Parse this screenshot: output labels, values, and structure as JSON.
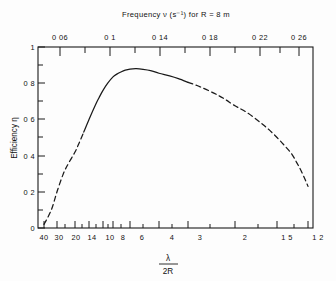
{
  "chart_data": {
    "type": "line",
    "title": "Frequency ν (s⁻¹) for R = 8 m",
    "xlabel": "λ / 2R",
    "xlabel_numerator": "λ",
    "xlabel_denominator": "2R",
    "ylabel": "Efficiency η",
    "ylim": [
      0,
      1
    ],
    "grid": false,
    "legend": null,
    "x_axis_bottom": {
      "name": "λ/2R",
      "scale": "reciprocal",
      "tick_labels": [
        "40",
        "30",
        "20",
        "14",
        "10",
        "8",
        "6",
        "4",
        "3",
        "2",
        "1 5",
        "1 2"
      ],
      "tick_values": [
        40,
        30,
        20,
        14,
        10,
        8,
        6,
        4,
        3,
        2,
        1.5,
        1.2
      ],
      "minor_tick_values": [
        25,
        18,
        16,
        12,
        9,
        7,
        5,
        3.5,
        2.5,
        1.75,
        1.35
      ],
      "range": [
        40,
        1.2
      ]
    },
    "x_axis_top": {
      "name": "Frequency ν (s⁻¹) for R = 8 m",
      "tick_labels": [
        "0 06",
        "0 1",
        "0 14",
        "0 18",
        "0 22",
        "0 26"
      ],
      "tick_values": [
        0.06,
        0.1,
        0.14,
        0.18,
        0.22,
        0.26
      ],
      "minor_tick_values": [
        0.08,
        0.12,
        0.16,
        0.2,
        0.24,
        0.28
      ],
      "units": "s^-1",
      "R_value": "8 m"
    },
    "y_axis": {
      "name": "Efficiency η",
      "tick_labels": [
        "0",
        "0 2",
        "0 4",
        "0 6",
        "0 8",
        "1"
      ],
      "tick_values": [
        0,
        0.2,
        0.4,
        0.6,
        0.8,
        1.0
      ],
      "minor_tick_values": [
        0.1,
        0.3,
        0.5,
        0.7,
        0.9
      ]
    },
    "series": [
      {
        "name": "efficiency",
        "line_color": "#1a1a1a",
        "segments": [
          {
            "style": "dashed",
            "x": [
              40,
              34,
              30,
              26,
              23,
              20,
              18,
              16
            ],
            "y": [
              0.02,
              0.1,
              0.2,
              0.3,
              0.36,
              0.42,
              0.47,
              0.53
            ]
          },
          {
            "style": "solid",
            "x": [
              16,
              14,
              12,
              11,
              10,
              9,
              8,
              7.5,
              7,
              6.5,
              6,
              5.5,
              5,
              4.5,
              4,
              3.6,
              3.3,
              3.0
            ],
            "y": [
              0.53,
              0.6,
              0.68,
              0.72,
              0.76,
              0.8,
              0.835,
              0.85,
              0.862,
              0.872,
              0.878,
              0.88,
              0.877,
              0.87,
              0.855,
              0.84,
              0.825,
              0.805
            ]
          },
          {
            "style": "dashed",
            "x": [
              3.0,
              2.7,
              2.4,
              2.2,
              2.0,
              1.85,
              1.7,
              1.6,
              1.5,
              1.42,
              1.35,
              1.3,
              1.26,
              1.22,
              1.2
            ],
            "y": [
              0.805,
              0.78,
              0.745,
              0.715,
              0.675,
              0.64,
              0.59,
              0.55,
              0.5,
              0.455,
              0.41,
              0.36,
              0.315,
              0.26,
              0.23
            ]
          }
        ]
      }
    ],
    "annotations": [
      {
        "text": "curve is dashed for extrapolated regions at both ends"
      }
    ]
  },
  "figure": {
    "background_color": "#fdfdfd",
    "line_color": "#1a1a1a"
  }
}
